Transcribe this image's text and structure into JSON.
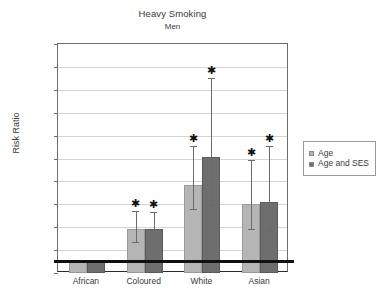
{
  "chart_data": {
    "type": "bar",
    "title": "Heavy Smoking",
    "subtitle": "Men",
    "xlabel": "",
    "ylabel": "Risk Ratio",
    "ylim": [
      0,
      20
    ],
    "ytick_step": 2,
    "yticks": [
      "20",
      "18",
      "16",
      "14",
      "12",
      "10",
      "8",
      "6",
      "4",
      "2",
      "0"
    ],
    "grid": true,
    "legend_position": "right",
    "reference_line": 1,
    "categories": [
      "African",
      "Coloured",
      "White",
      "Asian"
    ],
    "series": [
      {
        "name": "Age",
        "color": "#b5b5b5",
        "values": [
          1.0,
          3.85,
          7.7,
          6.0
        ],
        "ci_low": [
          null,
          2.7,
          5.6,
          3.8
        ],
        "ci_high": [
          null,
          5.4,
          11.1,
          9.9
        ],
        "significant": [
          false,
          true,
          true,
          true
        ]
      },
      {
        "name": "Age and SES",
        "color": "#6e6e6e",
        "values": [
          1.0,
          3.8,
          10.1,
          6.2
        ],
        "ci_low": [
          null,
          2.6,
          5.9,
          3.7
        ],
        "ci_high": [
          null,
          5.3,
          17.0,
          11.1
        ],
        "significant": [
          false,
          true,
          true,
          true
        ]
      }
    ],
    "significance_marker": "✱"
  },
  "legend": {
    "items": [
      {
        "label": "Age"
      },
      {
        "label": "Age and SES"
      }
    ]
  },
  "colors": {
    "series_age": "#b5b5b5",
    "series_age_ses": "#6e6e6e",
    "reference_line": "#111111",
    "gridline": "#d4d4d4",
    "axis": "#6d6d6d"
  }
}
